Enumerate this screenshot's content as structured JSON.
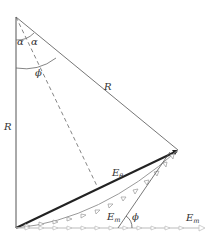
{
  "diagram": {
    "labels": {
      "alpha_left": "α",
      "alpha_right": "α",
      "phi_top": "ϕ",
      "R_vertical": "R",
      "R_diagonal": "R",
      "E_theta_main": "E",
      "E_theta_sub": "θ",
      "E_m_curve_main": "E",
      "E_m_curve_sub": "m",
      "phi_bottom": "ϕ",
      "E_m_axis_main": "E",
      "E_m_axis_sub": "m"
    },
    "caption": "FIG. 14.8 ... ... ... ... ..."
  },
  "colors": {
    "line": "#555555",
    "bold": "#222222",
    "arrow_chain": "#9a9a9a",
    "axis_chain": "#bbbbbb"
  }
}
